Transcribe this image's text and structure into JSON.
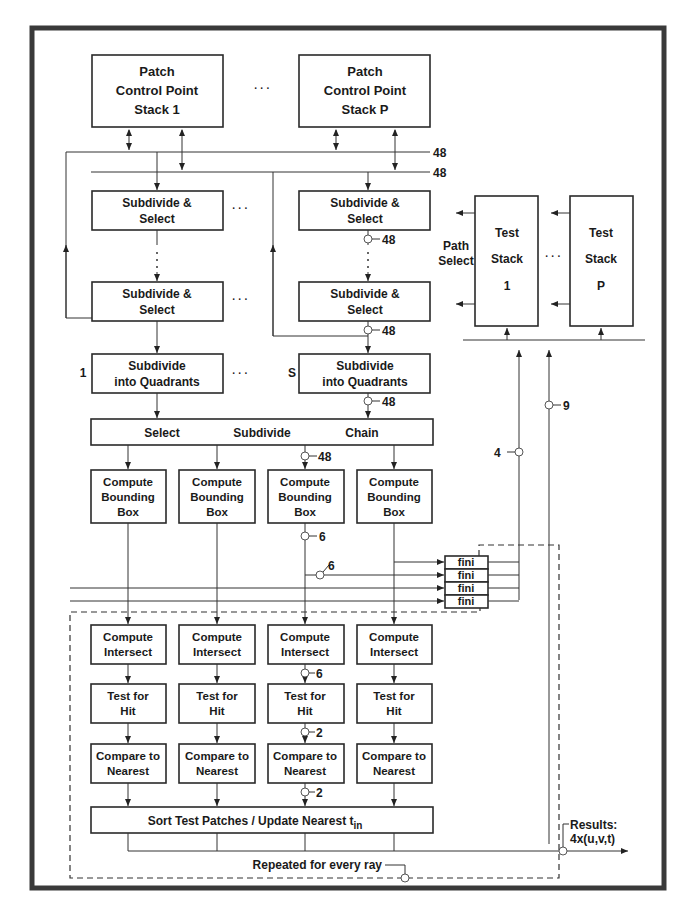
{
  "diagram": {
    "patch_stacks": [
      {
        "line1": "Patch",
        "line2": "Control Point",
        "line3": "Stack 1"
      },
      {
        "line1": "Patch",
        "line2": "Control Point",
        "line3": "Stack P"
      }
    ],
    "ellipsis": "· · ·",
    "bus_widths": {
      "bus_top": "48",
      "bus_second": "48"
    },
    "subdivide_select": {
      "line1": "Subdivide &",
      "line2": "Select"
    },
    "subdivide_quadrants": {
      "line1": "Subdivide",
      "line2": "into Quadrants"
    },
    "stage_labels": {
      "first": "1",
      "last": "S"
    },
    "link_widths": {
      "after_ss_1": "48",
      "after_ss_2": "48",
      "after_quad": "48",
      "after_chain": "48",
      "after_bbox": "6",
      "bbox_tap": "6",
      "after_intersect": "6",
      "after_hit": "2",
      "after_nearest": "2",
      "test_stack_in": "4",
      "test_stack_in2": "9"
    },
    "path_select": {
      "line1": "Path",
      "line2": "Select"
    },
    "test_stacks": [
      {
        "line1": "Test",
        "line2": "Stack",
        "line3": "1"
      },
      {
        "line1": "Test",
        "line2": "Stack",
        "line3": "P"
      }
    ],
    "chain_bar": {
      "select": "Select",
      "subdivide": "Subdivide",
      "chain": "Chain"
    },
    "bounding_box": {
      "line1": "Compute",
      "line2": "Bounding",
      "line3": "Box"
    },
    "fini_labels": [
      "fini",
      "fini",
      "fini",
      "fini"
    ],
    "compute_intersect": {
      "line1": "Compute",
      "line2": "Intersect"
    },
    "test_hit": {
      "line1": "Test for",
      "line2": "Hit"
    },
    "compare_nearest": {
      "line1": "Compare to",
      "line2": "Nearest"
    },
    "sort_bar": {
      "text": "Sort Test Patches / Update Nearest t",
      "subscript": "in"
    },
    "repeat_note": "Repeated for every ray",
    "results": {
      "line1": "Results:",
      "line2": "4x(u,v,t)"
    }
  }
}
